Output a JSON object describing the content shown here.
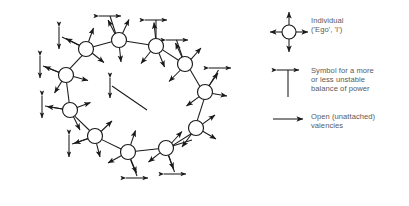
{
  "figure": {
    "type": "node-link-diagram",
    "stroke_color": "#1a1a1a",
    "text_color": "#5a5a5a",
    "background": "#ffffff",
    "node_fill": "#ffffff"
  },
  "legend": {
    "items": [
      {
        "symbol": "circle-with-four-arrows-icon",
        "label": "Individual\n('Ego', 'I')"
      },
      {
        "symbol": "double-headed-arrow-with-stem-icon",
        "label": "Symbol for a more\nor less unstable\nbalance of power"
      },
      {
        "symbol": "single-headed-arrow-icon",
        "label": "Open (unattached)\nvalencies"
      }
    ]
  },
  "diagram": {
    "node_count": 11,
    "node_radius": 7.5,
    "nodes": [
      {
        "id": "n1",
        "x": 119,
        "y": 40
      },
      {
        "id": "n2",
        "x": 156,
        "y": 46
      },
      {
        "id": "n3",
        "x": 185,
        "y": 64
      },
      {
        "id": "n4",
        "x": 205,
        "y": 92
      },
      {
        "id": "n5",
        "x": 196,
        "y": 128
      },
      {
        "id": "n6",
        "x": 166,
        "y": 148
      },
      {
        "id": "n7",
        "x": 128,
        "y": 152
      },
      {
        "id": "n8",
        "x": 95,
        "y": 136
      },
      {
        "id": "n9",
        "x": 70,
        "y": 110
      },
      {
        "id": "n10",
        "x": 66,
        "y": 75
      },
      {
        "id": "n11",
        "x": 86,
        "y": 49
      }
    ],
    "links": [
      [
        "n1",
        "n2"
      ],
      [
        "n2",
        "n3"
      ],
      [
        "n3",
        "n4"
      ],
      [
        "n4",
        "n5"
      ],
      [
        "n5",
        "n6"
      ],
      [
        "n6",
        "n7"
      ],
      [
        "n7",
        "n8"
      ],
      [
        "n8",
        "n9"
      ],
      [
        "n9",
        "n10"
      ],
      [
        "n10",
        "n11"
      ],
      [
        "n11",
        "n1"
      ]
    ],
    "open_valencies_per_node": [
      3,
      3,
      3,
      3,
      3,
      3,
      3,
      3,
      3,
      3,
      3
    ],
    "balance_symbol_count": 9,
    "stray_segments": 2
  }
}
